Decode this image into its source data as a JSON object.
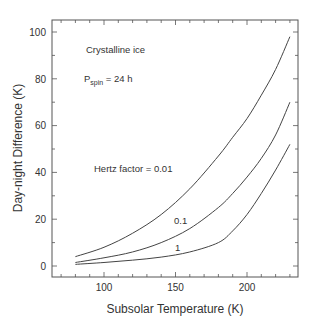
{
  "chart_data": {
    "type": "line",
    "title": "",
    "xlabel": "Subsolar Temperature (K)",
    "ylabel": "Day-night Difference (K)",
    "xlim": [
      63,
      235
    ],
    "ylim": [
      -4,
      105
    ],
    "xticks": [
      100,
      150,
      200
    ],
    "yticks": [
      0,
      20,
      40,
      60,
      80,
      100
    ],
    "grid": false,
    "annotations": {
      "material": "Crystalline ice",
      "spin_prefix": "P",
      "spin_sub": "spin",
      "spin_suffix": " = 24 h",
      "series_label_prefix": "Hertz factor = "
    },
    "x": [
      80,
      100,
      120,
      140,
      160,
      180,
      190,
      200,
      210,
      220,
      230
    ],
    "series": [
      {
        "name": "0.01",
        "label": "Hertz factor = 0.01",
        "values": [
          4,
          8,
          14,
          22,
          33,
          47,
          55,
          63,
          73,
          84,
          98
        ]
      },
      {
        "name": "0.1",
        "label": "0.1",
        "values": [
          1.5,
          3.5,
          6,
          10,
          16,
          25,
          31,
          38,
          46,
          56,
          70
        ]
      },
      {
        "name": "1",
        "label": "1",
        "values": [
          0.7,
          1.5,
          2.5,
          3.8,
          6,
          10,
          15,
          22,
          31,
          41,
          52
        ]
      }
    ],
    "line_color": "#444444"
  }
}
